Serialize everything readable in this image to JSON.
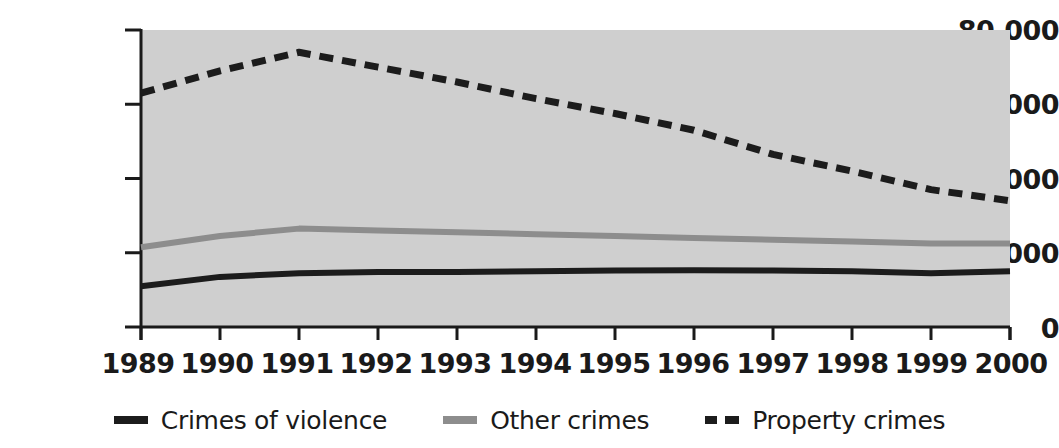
{
  "chart_data": {
    "type": "line",
    "title": "",
    "subtitle": "",
    "xlabel": "",
    "ylabel": "",
    "x": [
      1989,
      1990,
      1991,
      1992,
      1993,
      1994,
      1995,
      1996,
      1997,
      1998,
      1999,
      2000
    ],
    "categories": [
      "1989",
      "1990",
      "1991",
      "1992",
      "1993",
      "1994",
      "1995",
      "1996",
      "1997",
      "1998",
      "1999",
      "2000"
    ],
    "series": [
      {
        "name": "Crimes of violence",
        "style": "solid",
        "color": "#1c1c1c",
        "values": [
          11000,
          13500,
          14500,
          14800,
          14800,
          15000,
          15200,
          15300,
          15200,
          15000,
          14500,
          15000
        ]
      },
      {
        "name": "Other crimes",
        "style": "solid",
        "color": "#8d8d8d",
        "values": [
          21500,
          24500,
          26500,
          26000,
          25500,
          25000,
          24500,
          24000,
          23500,
          23000,
          22500,
          22500
        ]
      },
      {
        "name": "Property crimes",
        "style": "dashed",
        "color": "#1c1c1c",
        "values": [
          63000,
          69000,
          74000,
          70000,
          66000,
          61500,
          57500,
          53000,
          46500,
          42000,
          37000,
          34000
        ]
      }
    ],
    "ylim": [
      0,
      80000
    ],
    "yticks": [
      0,
      20000,
      40000,
      60000,
      80000
    ],
    "ytick_labels": [
      "0",
      "20,000",
      "40,000",
      "60,000",
      "80,000"
    ],
    "xtick_labels": [
      "1989",
      "1990",
      "1991",
      "1992",
      "1993",
      "1994",
      "1995",
      "1996",
      "1997",
      "1998",
      "1999",
      "2000"
    ],
    "grid": false,
    "legend_position": "bottom",
    "plot_background": "#cfcfcf",
    "page_background": "#ffffff",
    "axis_color": "#1a1a1a"
  },
  "legend": {
    "items": [
      {
        "label": "Crimes of violence",
        "swatch": "solid-dark"
      },
      {
        "label": "Other crimes",
        "swatch": "solid-gray"
      },
      {
        "label": "Property crimes",
        "swatch": "dashed-dark"
      }
    ]
  },
  "axes": {
    "y_labels": [
      "80,000",
      "60,000",
      "40,000",
      "20,000",
      "0"
    ],
    "x_labels": [
      "1989",
      "1990",
      "1991",
      "1992",
      "1993",
      "1994",
      "1995",
      "1996",
      "1997",
      "1998",
      "1999",
      "2000"
    ]
  }
}
